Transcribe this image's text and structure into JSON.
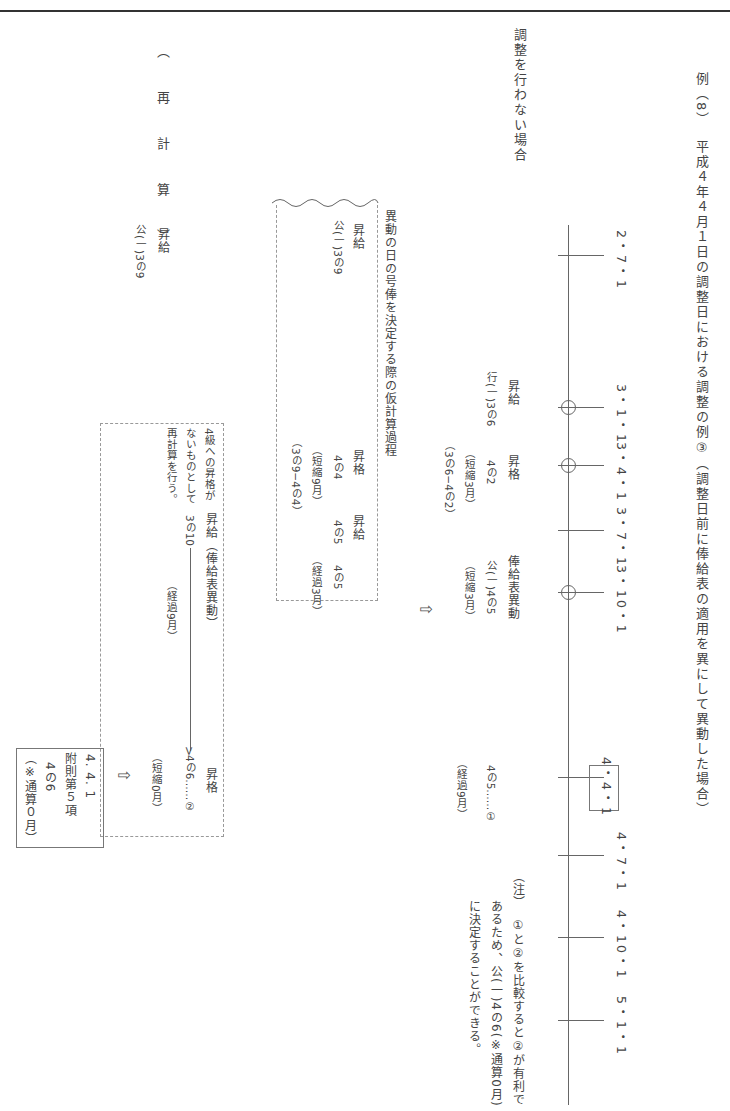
{
  "header": {
    "example_no": "例（8）",
    "title": "平成４年４月１日の調整日における調整の例③（調整日前に俸給表の適用を異にして異動した場合）"
  },
  "section_label": "調整を行わない場合",
  "recalc_label": "（　再　計　算　）",
  "timeline": {
    "dates": [
      {
        "label": "2・7・1",
        "circle": false
      },
      {
        "label": "3・1・1",
        "circle": true
      },
      {
        "label": "3・4・1",
        "circle": true
      },
      {
        "label": "3・7・1",
        "circle": false
      },
      {
        "label": "3・10・1",
        "circle": true
      },
      {
        "label": "4・4・1",
        "circle": false,
        "boxed": true
      },
      {
        "label": "4・7・1",
        "circle": false
      },
      {
        "label": "4・10・1",
        "circle": false
      },
      {
        "label": "5・1・1",
        "circle": false
      }
    ],
    "events": [
      {
        "type": "昇給",
        "grade": "行(一)3の6"
      },
      {
        "type": "昇格",
        "grade": "4の2",
        "note1": "（短縮3月）",
        "note2": "（3の6−4の2）"
      },
      {
        "type": "俸給表異動",
        "grade": "公(一)4の5",
        "note1": "（短縮3月）"
      },
      {
        "result": "4の5……①",
        "note1": "（経過9月）"
      }
    ]
  },
  "provisional": {
    "title": "異動の日の号俸を決定する際の仮計算過程",
    "col1": {
      "type": "昇給",
      "grade": "公(一)3の9"
    },
    "col2": {
      "type": "昇格",
      "grade": "4の4",
      "note1": "（短縮9月）",
      "note2": "（3の9−4の4）"
    },
    "col3": {
      "type": "昇給",
      "grade": "4の5"
    },
    "col4": {
      "grade": "4の5",
      "note1": "（経過3月）"
    }
  },
  "recalc": {
    "type": "昇給",
    "grade": "公(一)3の9",
    "note_line1": "4級への昇格が",
    "note_line2": "ないものとして",
    "note_line3": "再計算を行う。",
    "step_label": "昇給（俸給表異動）",
    "start": "3の10",
    "elapsed": "（経過9月）",
    "end_type": "昇格",
    "end_grade": "4の6……②",
    "end_note": "（短縮0月）"
  },
  "result_box": {
    "date": "4. 4. 1",
    "basis": "附則第５項",
    "grade": "4の6",
    "note": "（※通算０月）"
  },
  "footnote": {
    "mark": "（注）",
    "line1": "①と②を比較すると②が有利で",
    "line2": "あるため、公(一)4の6(※通算0月)",
    "line3": "に決定することができる。"
  },
  "arrow_symbol": "⇩"
}
